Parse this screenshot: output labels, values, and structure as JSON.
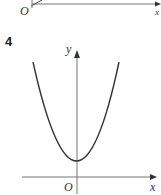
{
  "previous_figure": {
    "origin_label": "O",
    "x_axis_label": "x"
  },
  "question": {
    "number": "4"
  },
  "graph": {
    "y_axis_label": "y",
    "x_axis_label": "x",
    "origin_label": "O",
    "curve": "parabola opening upward with vertex on positive y-axis",
    "colors": {
      "axis": "#666666",
      "curve": "#333333"
    }
  }
}
